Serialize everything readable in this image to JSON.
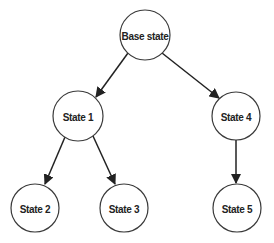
{
  "diagram": {
    "type": "tree",
    "nodes": [
      {
        "id": "base",
        "label": "Base state",
        "cx": 145,
        "cy": 35,
        "r": 25
      },
      {
        "id": "s1",
        "label": "State 1",
        "cx": 78,
        "cy": 116,
        "r": 25
      },
      {
        "id": "s4",
        "label": "State 4",
        "cx": 236,
        "cy": 116,
        "r": 24
      },
      {
        "id": "s2",
        "label": "State 2",
        "cx": 35,
        "cy": 208,
        "r": 24
      },
      {
        "id": "s3",
        "label": "State 3",
        "cx": 124,
        "cy": 208,
        "r": 24
      },
      {
        "id": "s5",
        "label": "State 5",
        "cx": 237,
        "cy": 208,
        "r": 24
      }
    ],
    "edges": [
      {
        "from": "base",
        "to": "s1"
      },
      {
        "from": "base",
        "to": "s4"
      },
      {
        "from": "s1",
        "to": "s2"
      },
      {
        "from": "s1",
        "to": "s3"
      },
      {
        "from": "s4",
        "to": "s5"
      }
    ],
    "colors": {
      "stroke": "#222222",
      "fill": "#ffffff"
    }
  }
}
